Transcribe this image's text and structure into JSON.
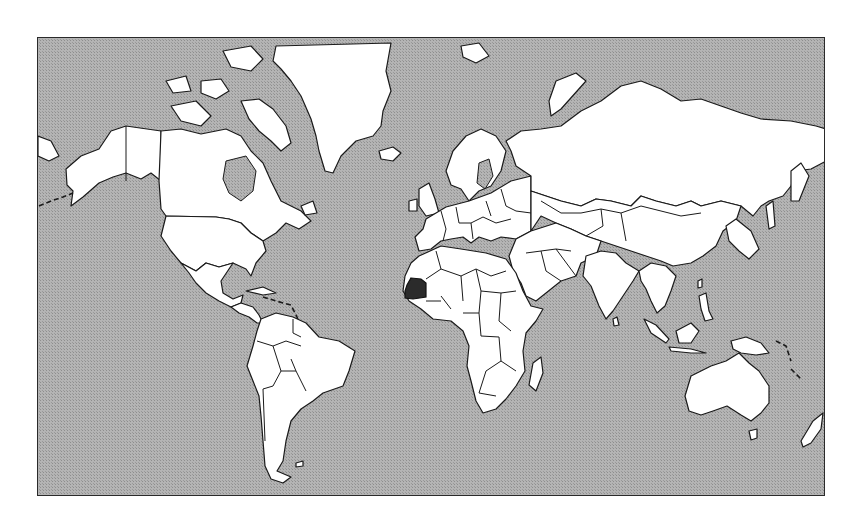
{
  "map": {
    "type": "world-outline",
    "projection": "mercator",
    "highlighted_country": "Mauritania",
    "colors": {
      "ocean": "#a9a9a9",
      "land": "#ffffff",
      "borders": "#1a1a1a",
      "highlight": "#2b2b2b",
      "frame": "#2a2a2a"
    }
  }
}
